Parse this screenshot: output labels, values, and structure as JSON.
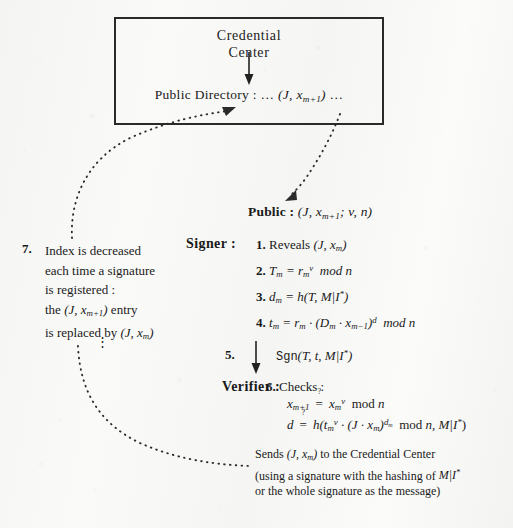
{
  "figure": {
    "type": "protocol-diagram",
    "credential_center": {
      "title_line1": "Credential",
      "title_line2": "Center",
      "arrow": "down-arrow",
      "public_directory": "Public Directory : … (J, xₘ₊₁) …",
      "public_directory_parts": {
        "label": "Public Directory : ",
        "ellipsis_left": "… ",
        "entry": "(J, x",
        "entry_sub": "m+1",
        "entry_close": ") ",
        "ellipsis_right": "…"
      }
    },
    "public_line": {
      "label": "Public :",
      "value": "(J, xₘ₊₁; v, n)"
    },
    "signer": {
      "label": "Signer :",
      "steps": [
        {
          "num": "1.",
          "text": "Reveals (J, xₘ)"
        },
        {
          "num": "2.",
          "text": "Tₘ = rₘᵛ  mod n"
        },
        {
          "num": "3.",
          "text": "dₘ = h(T, M|I*)"
        },
        {
          "num": "4.",
          "text": "tₘ = rₘ · (Dₘ · xₘ₋₁)ᵈ  mod n"
        }
      ]
    },
    "step5": {
      "num": "5.",
      "arrow": "down-arrow",
      "text": "Sgn(T, t, M|I*)"
    },
    "verifier": {
      "label": "Verifier :",
      "step_num": "6.",
      "step_label": "Checks :",
      "equations": [
        "xₘ₊₁ =? xₘᵛ  mod n",
        "d =? h(tₘᵛ · (J · xₘ)^dₘ  mod n, M|I*)"
      ],
      "question_mark": "?"
    },
    "sends": {
      "line1": "Sends (J, xₘ) to the Credential Center",
      "line2": "(using a signature with the hashing of M|I*",
      "line3": "or the whole signature as the message)"
    },
    "step7": {
      "num": "7.",
      "lines": [
        "Index is decreased",
        "each time a signature",
        "is registered :",
        "the (J, xₘ₊₁) entry",
        "is replaced by (J, xₘ)"
      ],
      "vertical_dots": "⋮"
    },
    "connectors": [
      {
        "name": "curve-step7-to-public-directory",
        "style": "dotted",
        "arrow_end": "upper-right"
      },
      {
        "name": "curve-box-to-public",
        "style": "dotted",
        "arrow_end": "lower-left"
      },
      {
        "name": "curve-step7-to-sends",
        "style": "dotted",
        "arrow_end": "none"
      }
    ],
    "colors": {
      "ink": "#1a1a1a",
      "paper": "#f7f7f6",
      "box_border": "#2a2a2a"
    }
  }
}
